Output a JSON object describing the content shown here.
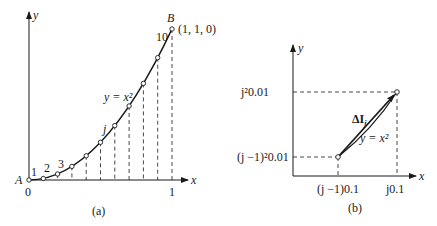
{
  "figure": {
    "panel_a": {
      "caption": "(a)",
      "x_axis_label": "x",
      "y_axis_label": "y",
      "origin_label": "0",
      "x_tick_label": "1",
      "start_point_label": "A",
      "end_point_label": "B",
      "end_point_coords": "(1, 1, 0)",
      "curve_label": "y = x²",
      "segment_labels": [
        "1",
        "2",
        "3",
        "j",
        "10"
      ],
      "num_segments": 10
    },
    "panel_b": {
      "caption": "(b)",
      "x_axis_label": "x",
      "y_axis_label": "y",
      "upper_y_label": "j²0.01",
      "lower_y_label": "(j −1)²0.01",
      "lower_x_label": "(j −1)0.1",
      "upper_x_label": "j0.1",
      "vector_label": "ΔI",
      "vector_subscript": "j",
      "curve_label": "y = x²"
    }
  },
  "colors": {
    "line": "#1a1a1a",
    "background": "#ffffff"
  }
}
